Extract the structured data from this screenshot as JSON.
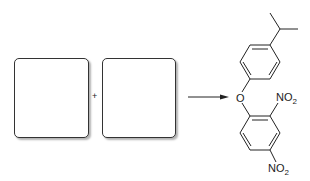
{
  "reaction": {
    "reactant_1": {
      "label": ""
    },
    "reactant_2": {
      "label": ""
    },
    "plus_sign": "+",
    "arrow": "reaction-arrow",
    "product": {
      "name": "4-isopropylphenyl 2,4-dinitrophenyl ether",
      "oxygen_label": "O",
      "nitro_label_top": "NO",
      "nitro_label_top_sub": "2",
      "nitro_label_bottom": "NO",
      "nitro_label_bottom_sub": "2"
    }
  }
}
